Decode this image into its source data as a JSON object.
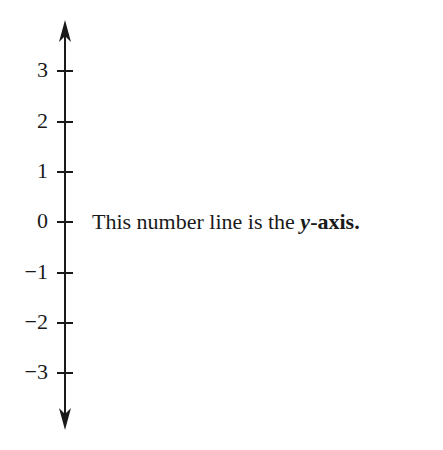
{
  "axis": {
    "ticks": [
      {
        "label": "3",
        "y": 71
      },
      {
        "label": "2",
        "y": 122
      },
      {
        "label": "1",
        "y": 172
      },
      {
        "label": "0",
        "y": 222
      },
      {
        "label": "−1",
        "y": 273
      },
      {
        "label": "−2",
        "y": 323
      },
      {
        "label": "−3",
        "y": 373
      }
    ]
  },
  "caption": {
    "prefix": "This number line is the ",
    "var": "y",
    "suffix": "-axis."
  }
}
